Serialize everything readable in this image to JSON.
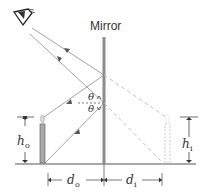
{
  "diagram": {
    "mirror_label": "Mirror",
    "labels": {
      "theta_top": "θ",
      "theta_bottom": "θ",
      "h_object": "h",
      "h_object_sub": "o",
      "h_image": "h",
      "h_image_sub": "i",
      "d_object": "d",
      "d_object_sub": "o",
      "d_image": "d",
      "d_image_sub": "i"
    },
    "elements": [
      "eye",
      "mirror",
      "object-candle",
      "image-candle",
      "incident-rays",
      "reflected-rays",
      "virtual-rays",
      "normal-line"
    ],
    "colors": {
      "ray": "#8a8a8a",
      "mirror": "#808080",
      "virtual": "#b8b8b8",
      "ground": "#555555",
      "text": "#333333"
    }
  }
}
